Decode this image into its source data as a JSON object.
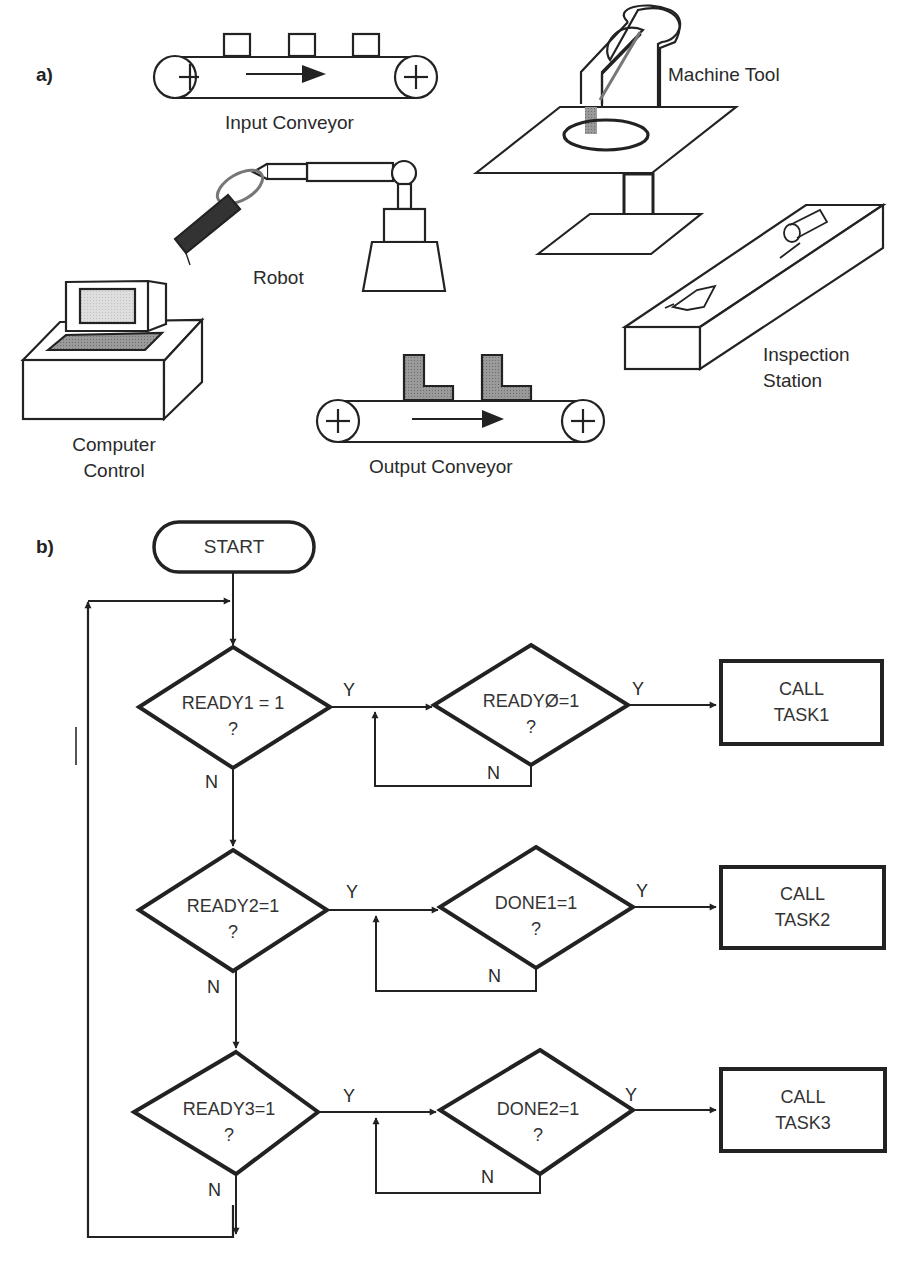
{
  "panels": {
    "a": {
      "label": "a)",
      "components": [
        {
          "id": "input-conveyor",
          "label": "Input Conveyor"
        },
        {
          "id": "machine-tool",
          "label": "Machine Tool"
        },
        {
          "id": "robot",
          "label": "Robot"
        },
        {
          "id": "computer-control",
          "label_line1": "Computer",
          "label_line2": "Control"
        },
        {
          "id": "inspection-station",
          "label_line1": "Inspection",
          "label_line2": "Station"
        },
        {
          "id": "output-conveyor",
          "label": "Output Conveyor"
        }
      ]
    },
    "b": {
      "label": "b)",
      "start": "START",
      "rows": [
        {
          "check": {
            "line1": "READY1 = 1",
            "line2": "?"
          },
          "wait": {
            "line1": "READYØ=1",
            "line2": "?"
          },
          "action": {
            "line1": "CALL",
            "line2": "TASK1"
          }
        },
        {
          "check": {
            "line1": "READY2=1",
            "line2": "?"
          },
          "wait": {
            "line1": "DONE1=1",
            "line2": "?"
          },
          "action": {
            "line1": "CALL",
            "line2": "TASK2"
          }
        },
        {
          "check": {
            "line1": "READY3=1",
            "line2": "?"
          },
          "wait": {
            "line1": "DONE2=1",
            "line2": "?"
          },
          "action": {
            "line1": "CALL",
            "line2": "TASK3"
          }
        }
      ],
      "yes_label": "Y",
      "no_label": "N"
    }
  },
  "colors": {
    "ink": "#222222",
    "shade": "#8a8a8a",
    "screen": "#d9d9d9"
  }
}
